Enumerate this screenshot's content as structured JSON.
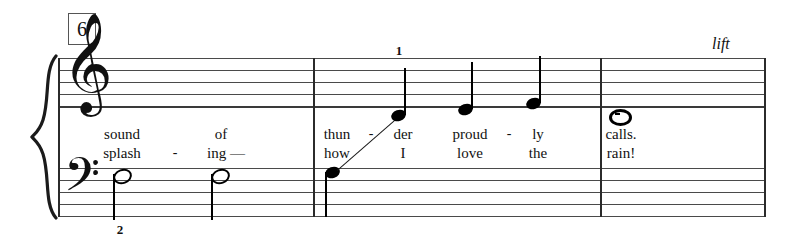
{
  "score": {
    "measure_number_box": "6",
    "expression_mark": "lift",
    "clefs": {
      "treble": "treble-clef",
      "bass": "bass-clef"
    },
    "colors": {
      "staff_line": "#4a4a4a",
      "ink": "#000000",
      "box_border": "#555555"
    },
    "fingerings": [
      {
        "value": "2",
        "x": 120,
        "y": 224
      },
      {
        "value": "1",
        "x": 398,
        "y": 46
      }
    ],
    "barlines": [
      {
        "name": "system-start",
        "x": 58
      },
      {
        "name": "measure-1-end",
        "x": 313
      },
      {
        "name": "measure-2-end",
        "x": 600
      },
      {
        "name": "system-end",
        "x": 765
      }
    ],
    "staves": {
      "treble": {
        "top": 58,
        "line_gap": 11.8,
        "lines": 5
      },
      "bass": {
        "top": 168,
        "line_gap": 11.8,
        "lines": 5
      }
    },
    "notes": [
      {
        "id": "n1",
        "staff": "bass",
        "duration": "half",
        "x": 120,
        "y": 174,
        "stem": "down"
      },
      {
        "id": "n2",
        "staff": "bass",
        "duration": "half",
        "x": 218,
        "y": 174,
        "stem": "down"
      },
      {
        "id": "n3",
        "staff": "bass",
        "duration": "quarter",
        "x": 332,
        "y": 172,
        "stem": "down"
      },
      {
        "id": "n4",
        "staff": "treble",
        "duration": "quarter",
        "x": 398,
        "y": 114,
        "stem": "up"
      },
      {
        "id": "n5",
        "staff": "treble",
        "duration": "quarter",
        "x": 465,
        "y": 108,
        "stem": "up"
      },
      {
        "id": "n6",
        "staff": "treble",
        "duration": "quarter",
        "x": 533,
        "y": 102,
        "stem": "up"
      },
      {
        "id": "n7",
        "staff": "treble",
        "duration": "whole",
        "x": 617,
        "y": 114,
        "stem": "none"
      }
    ],
    "lyrics": {
      "verse1": [
        {
          "text": "sound",
          "x": 122
        },
        {
          "text": "of",
          "x": 221
        },
        {
          "text": "thun",
          "x": 337
        },
        {
          "text": "-",
          "x": 371
        },
        {
          "text": "der",
          "x": 403
        },
        {
          "text": "proud",
          "x": 470
        },
        {
          "text": "-",
          "x": 509
        },
        {
          "text": "ly",
          "x": 538
        },
        {
          "text": "calls.",
          "x": 621
        }
      ],
      "verse2": [
        {
          "text": "splash",
          "x": 122
        },
        {
          "text": "-",
          "x": 175
        },
        {
          "text": "ing —",
          "x": 224
        },
        {
          "text": "how",
          "x": 337
        },
        {
          "text": "I",
          "x": 403
        },
        {
          "text": "love",
          "x": 470
        },
        {
          "text": "the",
          "x": 538
        },
        {
          "text": "rain!",
          "x": 621
        }
      ]
    }
  }
}
